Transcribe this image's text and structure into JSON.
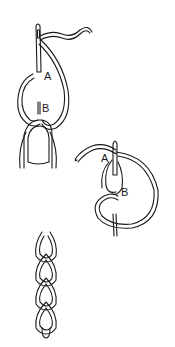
{
  "diagram": {
    "type": "embroidery-stitch-instructions",
    "stroke_color": "#1a1a1a",
    "background": "#ffffff",
    "figures": [
      {
        "id": "step-1",
        "description": "Needle inserted at A and brought up at B, thread looped under needle tip, held by thumb",
        "labels": {
          "a": "A",
          "b": "B"
        }
      },
      {
        "id": "step-2",
        "description": "Needle pulled through forming loop; next stitch inserted at A inside previous loop and up at B",
        "labels": {
          "a": "A",
          "b": "B"
        }
      },
      {
        "id": "result",
        "description": "Completed chain stitch row of linked loops",
        "links": 4
      }
    ]
  }
}
